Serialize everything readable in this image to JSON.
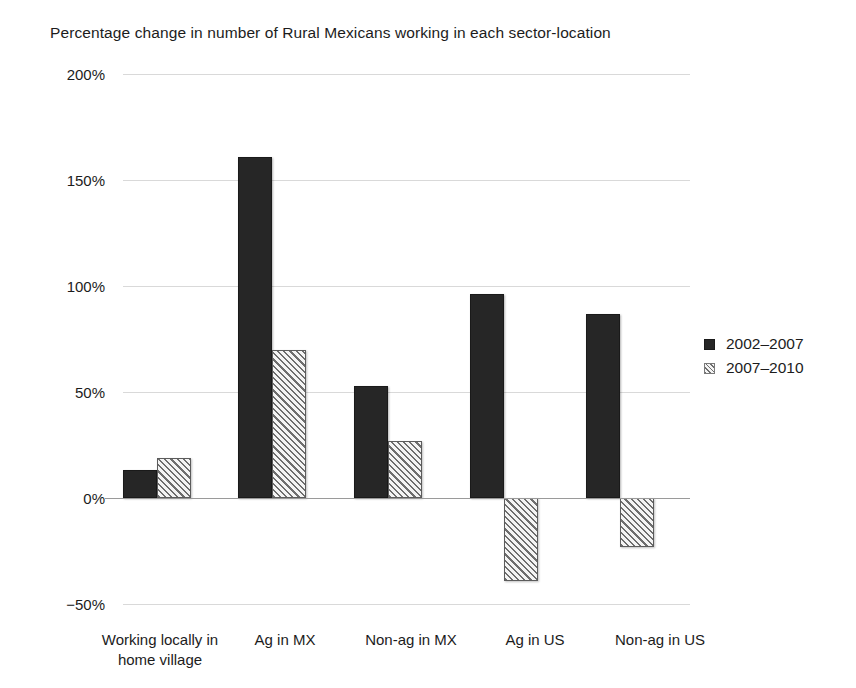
{
  "chart_data": {
    "type": "bar",
    "title": "Percentage change in number of Rural Mexicans working in each sector-location",
    "xlabel": "",
    "ylabel": "",
    "categories": [
      "Working locally in home village",
      "Ag in MX",
      "Non-ag in MX",
      "Ag in US",
      "Non-ag in US"
    ],
    "series": [
      {
        "name": "2002–2007",
        "values": [
          13,
          161,
          53,
          96,
          87
        ],
        "color": "#262626",
        "fill": "solid"
      },
      {
        "name": "2007–2010",
        "values": [
          19,
          70,
          27,
          -39,
          -23
        ],
        "color": "#f2f2f2",
        "fill": "diagonal-hatch"
      }
    ],
    "ylim": [
      -50,
      200
    ],
    "yticks": [
      200,
      150,
      100,
      50,
      0,
      -50
    ],
    "ytick_labels": [
      "200%",
      "150%",
      "100%",
      "50%",
      "0%",
      "−50%"
    ],
    "grid": true,
    "legend_position": "right",
    "value_unit": "percent"
  },
  "axis": {
    "y_labels": [
      "200%",
      "150%",
      "100%",
      "50%",
      "0%",
      "−50%"
    ],
    "x_labels": [
      {
        "line1": "Working locally in",
        "line2": "home village"
      },
      {
        "line1": "Ag in MX",
        "line2": ""
      },
      {
        "line1": "Non-ag in MX",
        "line2": ""
      },
      {
        "line1": "Ag in US",
        "line2": ""
      },
      {
        "line1": "Non-ag in US",
        "line2": ""
      }
    ]
  },
  "legend": {
    "items": [
      {
        "label": "2002–2007"
      },
      {
        "label": "2007–2010"
      }
    ]
  }
}
